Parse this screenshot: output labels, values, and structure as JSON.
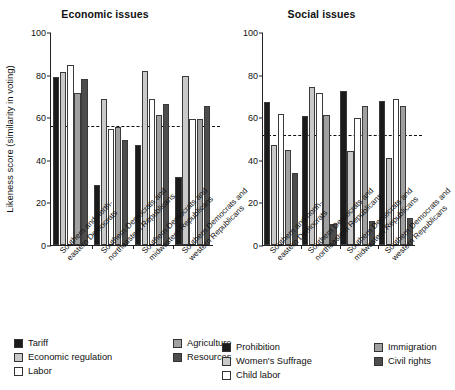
{
  "ylabel": "Likeness score (similarity in voting)",
  "yticks": [
    0,
    20,
    40,
    60,
    80,
    100
  ],
  "categories": [
    [
      "Southern and north-",
      "eastern Democrats"
    ],
    [
      "Southern Democrats and",
      "northeastern Republicans"
    ],
    [
      "Southern Democrats and",
      "midwestern Republicans"
    ],
    [
      "Southern Democrats and",
      "western Republicans"
    ]
  ],
  "panels": [
    {
      "title": "Economic issues",
      "refline": 56.5,
      "legend": [
        {
          "label": "Tariff",
          "color": "#1b1b1b"
        },
        {
          "label": "Economic regulation",
          "color": "#c9c9c9"
        },
        {
          "label": "Labor",
          "color": "#ffffff"
        },
        {
          "label": "Agriculture",
          "color": "#a0a0a0"
        },
        {
          "label": "Resources",
          "color": "#4d4d4d"
        }
      ],
      "series": [
        {
          "name": "Tariff",
          "values": [
            79,
            28,
            47,
            32
          ]
        },
        {
          "name": "Economic regulation",
          "values": [
            81,
            68.5,
            81.5,
            79.5
          ]
        },
        {
          "name": "Labor",
          "values": [
            84.5,
            54.5,
            68.5,
            59
          ]
        },
        {
          "name": "Agriculture",
          "values": [
            71.5,
            55.5,
            61,
            59
          ]
        },
        {
          "name": "Resources",
          "values": [
            78,
            49.5,
            66,
            65.5
          ]
        }
      ]
    },
    {
      "title": "Social issues",
      "refline": 52,
      "legend": [
        {
          "label": "Prohibition",
          "color": "#1b1b1b"
        },
        {
          "label": "Women's Suffrage",
          "color": "#c9c9c9"
        },
        {
          "label": "Child labor",
          "color": "#ffffff"
        },
        {
          "label": "Immigration",
          "color": "#a0a0a0"
        },
        {
          "label": "Civil rights",
          "color": "#4d4d4d"
        }
      ],
      "series": [
        {
          "name": "Prohibition",
          "values": [
            67,
            60.5,
            72.5,
            67.5
          ]
        },
        {
          "name": "Women's Suffrage",
          "values": [
            47,
            74,
            44,
            41
          ]
        },
        {
          "name": "Child labor",
          "values": [
            61.5,
            71.5,
            59.5,
            68.5
          ]
        },
        {
          "name": "Immigration",
          "values": [
            44.5,
            61,
            65.5,
            65.5
          ]
        },
        {
          "name": "Civil rights",
          "values": [
            34,
            10,
            11.5,
            12.5
          ]
        }
      ]
    }
  ],
  "chart_data": {
    "type": "bar",
    "xlabel": "",
    "ylabel": "Likeness score (similarity in voting)",
    "ylim": [
      0,
      100
    ],
    "yticks": [
      0,
      20,
      40,
      60,
      80,
      100
    ],
    "grid": false,
    "legend_position": "bottom",
    "categories": [
      "Southern and northeastern Democrats",
      "Southern Democrats and northeastern Republicans",
      "Southern Democrats and midwestern Republicans",
      "Southern Democrats and western Republicans"
    ],
    "panels": [
      {
        "title": "Economic issues",
        "reference_line": 56.5,
        "series": [
          {
            "name": "Tariff",
            "values": [
              79,
              28,
              47,
              32
            ],
            "color": "#1b1b1b"
          },
          {
            "name": "Economic regulation",
            "values": [
              81,
              68.5,
              81.5,
              79.5
            ],
            "color": "#c9c9c9"
          },
          {
            "name": "Labor",
            "values": [
              84.5,
              54.5,
              68.5,
              59
            ],
            "color": "#ffffff"
          },
          {
            "name": "Agriculture",
            "values": [
              71.5,
              55.5,
              61,
              59
            ],
            "color": "#a0a0a0"
          },
          {
            "name": "Resources",
            "values": [
              78,
              49.5,
              66,
              65.5
            ],
            "color": "#4d4d4d"
          }
        ]
      },
      {
        "title": "Social issues",
        "reference_line": 52,
        "series": [
          {
            "name": "Prohibition",
            "values": [
              67,
              60.5,
              72.5,
              67.5
            ],
            "color": "#1b1b1b"
          },
          {
            "name": "Women's Suffrage",
            "values": [
              47,
              74,
              44,
              41
            ],
            "color": "#c9c9c9"
          },
          {
            "name": "Child labor",
            "values": [
              61.5,
              71.5,
              59.5,
              68.5
            ],
            "color": "#ffffff"
          },
          {
            "name": "Immigration",
            "values": [
              44.5,
              61,
              65.5,
              65.5
            ],
            "color": "#a0a0a0"
          },
          {
            "name": "Civil rights",
            "values": [
              34,
              10,
              11.5,
              12.5
            ],
            "color": "#4d4d4d"
          }
        ]
      }
    ]
  }
}
